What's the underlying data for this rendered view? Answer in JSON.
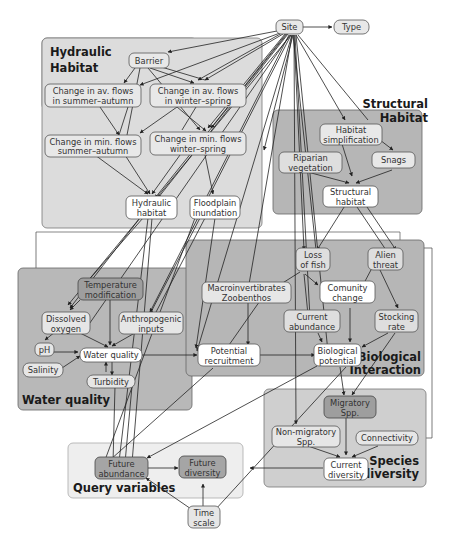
{
  "colors": {
    "group_light": "#d9d9d9",
    "group_mid": "#b5b5b5",
    "group_query": "#ececec",
    "node_white": "#ffffff",
    "node_light": "#e6e6e6",
    "node_dark": "#9a9a9a",
    "edge": "#222222"
  },
  "groups": [
    {
      "id": "hydraulic",
      "title": [
        "Hydraulic",
        "Habitat"
      ],
      "x": 40,
      "y": 38,
      "w": 155,
      "h": 72,
      "h2": 110
    },
    {
      "id": "structural",
      "title": [
        "Structural",
        "Habitat"
      ]
    },
    {
      "id": "water",
      "title": [
        "Water quality"
      ]
    },
    {
      "id": "biological",
      "title": [
        "Biological",
        "Interaction"
      ]
    },
    {
      "id": "species",
      "title": [
        "Species",
        "diversity"
      ]
    },
    {
      "id": "query",
      "title": [
        "Query variables"
      ]
    }
  ],
  "nodes": {
    "site": {
      "lines": [
        "Site"
      ]
    },
    "type": {
      "lines": [
        "Type"
      ]
    },
    "barrier": {
      "lines": [
        "Barrier"
      ]
    },
    "av_summer": {
      "lines": [
        "Change in av. flows",
        "in summer–autumn"
      ]
    },
    "av_winter": {
      "lines": [
        "Change in av. flows",
        "in winter–spring"
      ]
    },
    "min_summer": {
      "lines": [
        "Change in min. flows",
        "summer–autumn"
      ]
    },
    "min_winter": {
      "lines": [
        "Change in min. flows",
        "winter–spring"
      ]
    },
    "hydraulic_habitat": {
      "lines": [
        "Hydraulic",
        "habitat"
      ]
    },
    "floodplain": {
      "lines": [
        "Floodplain",
        "inundation"
      ]
    },
    "habitat_simpl": {
      "lines": [
        "Habitat",
        "simplification"
      ]
    },
    "riparian": {
      "lines": [
        "Riparian",
        "vegetation"
      ]
    },
    "snags": {
      "lines": [
        "Snags"
      ]
    },
    "structural_habitat": {
      "lines": [
        "Structural",
        "habitat"
      ]
    },
    "temperature": {
      "lines": [
        "Temperature",
        "modification"
      ]
    },
    "dissolved": {
      "lines": [
        "Dissolved",
        "oxygen"
      ]
    },
    "anthropogenic": {
      "lines": [
        "Anthropogenic",
        "inputs"
      ]
    },
    "ph": {
      "lines": [
        "pH"
      ]
    },
    "salinity": {
      "lines": [
        "Salinity"
      ]
    },
    "water_quality": {
      "lines": [
        "Water quality"
      ]
    },
    "turbidity": {
      "lines": [
        "Turbidity"
      ]
    },
    "loss_fish": {
      "lines": [
        "Loss",
        "of fish"
      ]
    },
    "alien": {
      "lines": [
        "Alien",
        "threat"
      ]
    },
    "macro": {
      "lines": [
        "Macroinvertibrates",
        "Zoobenthos"
      ]
    },
    "community": {
      "lines": [
        "Comunity",
        "change"
      ]
    },
    "current_abund": {
      "lines": [
        "Current",
        "abundance"
      ]
    },
    "stocking": {
      "lines": [
        "Stocking",
        "rate"
      ]
    },
    "potential_recr": {
      "lines": [
        "Potential",
        "recruitment"
      ]
    },
    "bio_potential": {
      "lines": [
        "Biological",
        "potential"
      ]
    },
    "migratory": {
      "lines": [
        "Migratory",
        "Spp."
      ]
    },
    "non_migratory": {
      "lines": [
        "Non-migratory",
        "Spp."
      ]
    },
    "connectivity": {
      "lines": [
        "Connectivity"
      ]
    },
    "current_div": {
      "lines": [
        "Current",
        "diversity"
      ]
    },
    "future_abund": {
      "lines": [
        "Future",
        "abundance"
      ]
    },
    "future_div": {
      "lines": [
        "Future",
        "diversity"
      ]
    },
    "time_scale": {
      "lines": [
        "Time",
        "scale"
      ]
    }
  }
}
